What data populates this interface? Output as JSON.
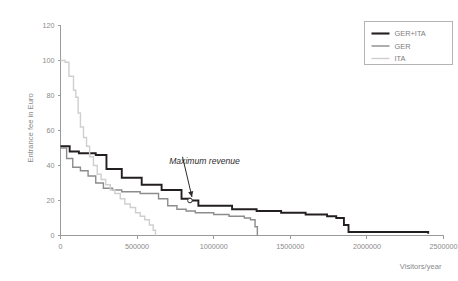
{
  "chart_data": {
    "type": "line",
    "title": "",
    "subtitle": "",
    "xlabel": "Visitors/year",
    "ylabel": "Entrance fee in Euro",
    "xlim": [
      0,
      2500000
    ],
    "ylim": [
      0,
      120
    ],
    "xticks": [
      0,
      500000,
      1000000,
      1500000,
      2000000,
      2500000
    ],
    "xticklabels": [
      "0",
      "500000",
      "1000000",
      "1500000",
      "2000000",
      "2500000"
    ],
    "yticks": [
      0,
      20,
      40,
      60,
      80,
      100,
      120
    ],
    "yticklabels": [
      "0",
      "20",
      "40",
      "60",
      "80",
      "100",
      "120"
    ],
    "grid": false,
    "legend_position": "top-right",
    "drawstyle": "steps-post",
    "series": [
      {
        "name": "GER+ITA",
        "color": "#231f20",
        "width": 1.9,
        "x": [
          0,
          60000,
          120000,
          175000,
          230000,
          280000,
          300000,
          355000,
          400000,
          470000,
          530000,
          600000,
          660000,
          720000,
          790000,
          845000,
          900000,
          980000,
          1060000,
          1120000,
          1200000,
          1280000,
          1360000,
          1440000,
          1520000,
          1600000,
          1680000,
          1740000,
          1800000,
          1850000,
          1880000,
          1950000,
          2100000,
          2250000,
          2380000,
          2400000
        ],
        "y": [
          51,
          48,
          47,
          47,
          46,
          46,
          38,
          38,
          33,
          33,
          29,
          29,
          26,
          26,
          21,
          20,
          17,
          17,
          17,
          15,
          15,
          14,
          14,
          13,
          13,
          12,
          12,
          11,
          10,
          6,
          2,
          2,
          2,
          2,
          2,
          1
        ]
      },
      {
        "name": "GER",
        "color": "#8c8c8c",
        "width": 1.4,
        "x": [
          0,
          40000,
          80000,
          130000,
          180000,
          230000,
          280000,
          340000,
          400000,
          460000,
          520000,
          580000,
          640000,
          700000,
          760000,
          820000,
          880000,
          940000,
          1000000,
          1060000,
          1100000,
          1160000,
          1200000,
          1240000,
          1270000,
          1285000
        ],
        "y": [
          50,
          44,
          39,
          37,
          34,
          30,
          27,
          26,
          25,
          25,
          24,
          24,
          21,
          17,
          15,
          14,
          13,
          13,
          12,
          12,
          11,
          11,
          10,
          9,
          5,
          0
        ]
      },
      {
        "name": "ITA",
        "color": "#cfcfcf",
        "width": 1.4,
        "x": [
          0,
          30000,
          55000,
          70000,
          85000,
          100000,
          115000,
          130000,
          150000,
          170000,
          190000,
          215000,
          240000,
          265000,
          295000,
          325000,
          355000,
          390000,
          420000,
          455000,
          490000,
          520000,
          550000,
          580000,
          605000,
          620000
        ],
        "y": [
          100,
          99,
          91,
          91,
          83,
          79,
          70,
          62,
          56,
          51,
          45,
          40,
          35,
          32,
          29,
          26,
          24,
          21,
          18,
          16,
          13,
          11,
          9,
          6,
          3,
          0
        ]
      }
    ],
    "annotations": [
      {
        "label": "Maximum revenue",
        "point_x": 845000,
        "point_y": 20,
        "label_x": 940000,
        "label_y": 41
      }
    ]
  },
  "legend": {
    "entries": [
      {
        "label": "GER+ITA",
        "color": "#231f20"
      },
      {
        "label": "GER",
        "color": "#8c8c8c"
      },
      {
        "label": "ITA",
        "color": "#cfcfcf"
      }
    ]
  }
}
